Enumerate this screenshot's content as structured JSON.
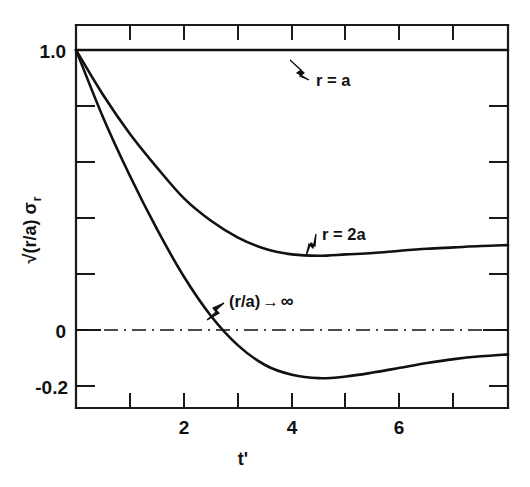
{
  "chart_data": {
    "type": "line",
    "title": "",
    "xlabel": "t'",
    "ylabel": "√(r/a) σ_r",
    "xlim": [
      0,
      8
    ],
    "ylim": [
      -0.2,
      1.08
    ],
    "grid": false,
    "legend_position": "inline-annotations",
    "x_ticks_major": [
      2,
      4,
      6
    ],
    "x_ticks_all": [
      0,
      1,
      2,
      3,
      4,
      5,
      6,
      7,
      8
    ],
    "x_tick_labels": [
      "2",
      "4",
      "6"
    ],
    "y_ticks_major": [
      1.0,
      0,
      -0.2
    ],
    "y_tick_labels": [
      "1.0",
      "0",
      "-0.2"
    ],
    "y_ticks_minor": [
      0.8,
      0.6,
      0.4,
      0.2
    ],
    "zero_reference_line": {
      "value": 0,
      "style": "dash-dot"
    },
    "series": [
      {
        "name": "r = a",
        "label": "r = a",
        "annotation_x": 5.3,
        "x": [
          0,
          1,
          2,
          3,
          4,
          5,
          6,
          7,
          8
        ],
        "values": [
          1.0,
          1.0,
          1.0,
          1.0,
          1.0,
          1.0,
          1.0,
          1.0,
          1.0
        ]
      },
      {
        "name": "r = 2a",
        "label": "r = 2a",
        "annotation_x": 4.3,
        "x": [
          0,
          0.5,
          1,
          1.5,
          2,
          2.5,
          3,
          3.5,
          4,
          4.5,
          5,
          5.5,
          6,
          6.5,
          7,
          7.5,
          8
        ],
        "values": [
          1.0,
          0.84,
          0.7,
          0.58,
          0.47,
          0.39,
          0.33,
          0.29,
          0.27,
          0.265,
          0.27,
          0.275,
          0.283,
          0.29,
          0.295,
          0.3,
          0.303
        ]
      },
      {
        "name": "(r/a) → ∞",
        "label": "(r/a) → ∞",
        "annotation_x": 3.2,
        "x": [
          0,
          0.5,
          1,
          1.5,
          2,
          2.5,
          3,
          3.5,
          4,
          4.5,
          5,
          5.5,
          6,
          6.5,
          7,
          7.5,
          8
        ],
        "values": [
          1.0,
          0.76,
          0.55,
          0.36,
          0.19,
          0.05,
          -0.055,
          -0.125,
          -0.16,
          -0.172,
          -0.166,
          -0.152,
          -0.135,
          -0.118,
          -0.104,
          -0.094,
          -0.087
        ]
      }
    ]
  },
  "axes": {
    "y_label": "√(r/a) σ",
    "y_label_sub": "r",
    "x_label": "t'",
    "y_tick_top": "1.0",
    "y_tick_zero": "0",
    "y_tick_bottom": "-0.2",
    "x_tick_2": "2",
    "x_tick_4": "4",
    "x_tick_6": "6"
  },
  "annotations": {
    "curve_1": "r = a",
    "curve_2": "r = 2a",
    "curve_3_prefix": "(r/a)",
    "curve_3_arrow": "→",
    "curve_3_suffix": "∞"
  },
  "colors": {
    "ink": "#111111",
    "background": "#ffffff"
  }
}
